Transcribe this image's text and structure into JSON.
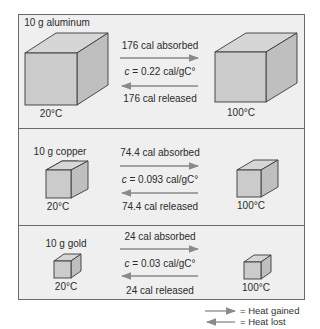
{
  "panels": [
    {
      "material": "10 g aluminum",
      "temp_start": "20°C",
      "temp_end": "100°C",
      "absorbed": "176 cal absorbed",
      "specific_heat_symbol": "c",
      "specific_heat_value": " = 0.22 cal/gC°",
      "released": "176 cal released"
    },
    {
      "material": "10 g copper",
      "temp_start": "20°C",
      "temp_end": "100°C",
      "absorbed": "74.4 cal absorbed",
      "specific_heat_symbol": "c",
      "specific_heat_value": " = 0.093 cal/gC°",
      "released": "74.4 cal released"
    },
    {
      "material": "10 g gold",
      "temp_start": "20°C",
      "temp_end": "100°C",
      "absorbed": "24 cal absorbed",
      "specific_heat_symbol": "c",
      "specific_heat_value": " = 0.03 cal/gC°",
      "released": "24 cal released"
    }
  ],
  "legend": {
    "gained": "= Heat gained",
    "lost": "= Heat lost"
  },
  "colors": {
    "panel_bg": "#efefef",
    "cube_front": "#c9c9c9",
    "cube_top": "#d4d4d4",
    "cube_side": "#bdbdbd",
    "arrow": "#8a8a8a"
  }
}
